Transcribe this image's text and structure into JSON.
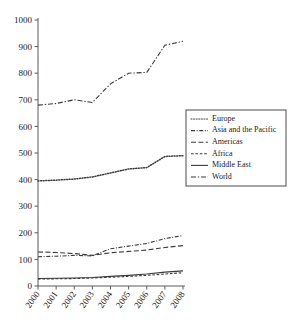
{
  "chart_data": {
    "type": "line",
    "title": "",
    "xlabel": "",
    "ylabel": "",
    "x": [
      2000,
      2001,
      2002,
      2003,
      2004,
      2005,
      2006,
      2007,
      2008
    ],
    "categories": [
      "2000",
      "2001",
      "2002",
      "2003",
      "2004",
      "2005",
      "2006",
      "2007",
      "2008"
    ],
    "xlim": [
      2000,
      2008
    ],
    "ylim": [
      0,
      1000
    ],
    "yticks": [
      0,
      100,
      200,
      300,
      400,
      500,
      600,
      700,
      800,
      900,
      1000
    ],
    "ytick_labels": [
      "0",
      "100",
      "200",
      "300",
      "400",
      "500",
      "600",
      "700",
      "800",
      "900",
      "1000"
    ],
    "grid": false,
    "legend_position": "right",
    "series": [
      {
        "name": "Europe",
        "style": "dotted",
        "color": "#3a3a3a",
        "values": [
          395,
          398,
          402,
          410,
          425,
          440,
          445,
          487,
          490
        ]
      },
      {
        "name": "Asia and the Pacific",
        "style": "dash-dot",
        "color": "#3a3a3a",
        "values": [
          110,
          112,
          115,
          113,
          140,
          150,
          160,
          178,
          190
        ]
      },
      {
        "name": "Americas",
        "style": "dashed-long",
        "color": "#3a3a3a",
        "values": [
          128,
          126,
          122,
          115,
          125,
          130,
          135,
          145,
          152
        ]
      },
      {
        "name": "Africa",
        "style": "dashed-short",
        "color": "#3a3a3a",
        "values": [
          26,
          27,
          28,
          30,
          33,
          36,
          40,
          45,
          50
        ]
      },
      {
        "name": "Middle East",
        "style": "solid",
        "color": "#3a3a3a",
        "values": [
          28,
          29,
          30,
          32,
          36,
          40,
          45,
          52,
          57
        ]
      },
      {
        "name": "World",
        "style": "dash-dot-long",
        "color": "#3a3a3a",
        "values": [
          680,
          686,
          700,
          690,
          760,
          800,
          803,
          905,
          920
        ]
      }
    ]
  },
  "legend": {
    "items": [
      {
        "label": "Europe"
      },
      {
        "label": "Asia and the Pacific"
      },
      {
        "label": "Americas"
      },
      {
        "label": "Africa"
      },
      {
        "label": "Middle East"
      },
      {
        "label": "World"
      }
    ]
  }
}
